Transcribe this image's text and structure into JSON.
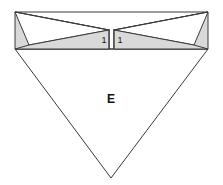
{
  "figure": {
    "background_color": "#ffffff",
    "stroke_color": "#3a3a3a",
    "fill_white": "#ffffff",
    "fill_gray": "#d9d9d9",
    "fill_gray_dark": "#cfcfcf",
    "labels": {
      "main": "E",
      "left_segment": "1",
      "right_segment": "1"
    },
    "label_positions": {
      "main": {
        "x": 111,
        "y": 100
      },
      "left_segment": {
        "x": 104,
        "y": 41
      },
      "right_segment": {
        "x": 120,
        "y": 41
      }
    },
    "geometry": {
      "top_left": {
        "x": 15,
        "y": 12
      },
      "top_right": {
        "x": 208,
        "y": 12
      },
      "band_left": {
        "x": 15,
        "y": 49
      },
      "band_right": {
        "x": 208,
        "y": 49
      },
      "bottom_apex": {
        "x": 111,
        "y": 178
      },
      "center_gap_left": {
        "x": 109,
        "y": 30
      },
      "center_gap_right": {
        "x": 114,
        "y": 30
      }
    },
    "shapes": [
      {
        "name": "main-inverted-triangle",
        "fill": "#ffffff",
        "points": "15,49 208,49 111,178"
      },
      {
        "name": "upper-gray-band-left",
        "fill": "#d9d9d9",
        "points": "15,12 109,30 109,49 15,49"
      },
      {
        "name": "upper-gray-band-right",
        "fill": "#d9d9d9",
        "points": "208,12 114,30 114,49 208,49"
      },
      {
        "name": "left-white-wedge",
        "fill": "#ffffff",
        "points": "15,12 109,30 29,45"
      },
      {
        "name": "right-white-wedge",
        "fill": "#ffffff",
        "points": "208,12 114,30 194,45"
      },
      {
        "name": "left-segment-cell",
        "fill": "#d9d9d9",
        "points": "109,30 109,49 104,49 104,30"
      },
      {
        "name": "right-segment-cell",
        "fill": "#d9d9d9",
        "points": "114,30 114,49 119,49 119,30"
      }
    ]
  }
}
